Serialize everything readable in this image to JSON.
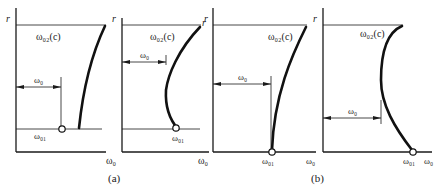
{
  "figure": {
    "caption_a": "(a)",
    "caption_b": "(b)",
    "axis_y_label": "r",
    "axis_x_label": "ω₀"
  },
  "panels": [
    {
      "id": "a1",
      "y_label": "r",
      "x_label": "ω₀",
      "curve_label": "ω₀₂(c)",
      "dimension_label": "ω₀",
      "point_label": "ω₀₁"
    },
    {
      "id": "a2",
      "y_label": "r",
      "x_label": "ω₀",
      "curve_label": "ω₀₂(c)",
      "dimension_label": "ω₀",
      "point_label": "ω₀₁"
    },
    {
      "id": "b1",
      "y_label": "r",
      "x_label": "ω₀",
      "curve_label": "ω₀₂(c)",
      "dimension_label": "ω₀",
      "point_label": "ω₀₁"
    },
    {
      "id": "b2",
      "y_label": "r",
      "x_label": "ω₀",
      "curve_label": "ω₀₂(c)",
      "dimension_label": "ω₀",
      "point_label": "ω₀₁"
    }
  ],
  "colors": {
    "ink": "#1a1a1a",
    "background": "#ffffff"
  }
}
